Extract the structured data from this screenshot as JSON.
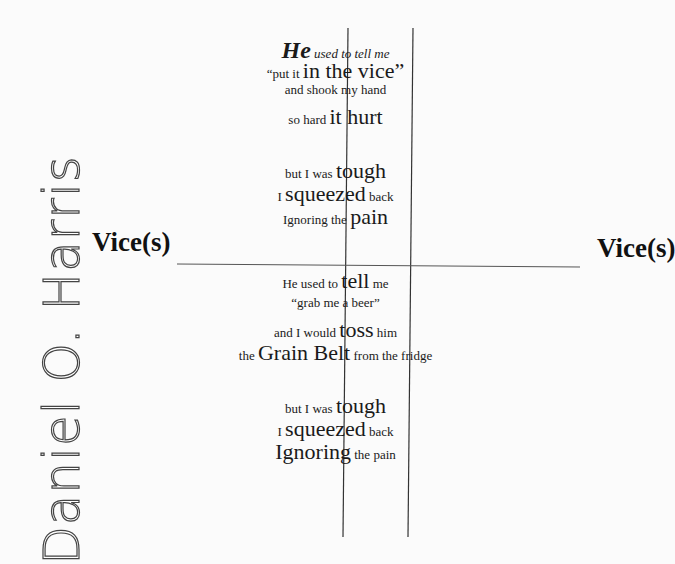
{
  "author": "Daniel O. Harris",
  "title_left": "Vice(s)",
  "title_right": "Vice(s)",
  "stanza1": [
    {
      "parts": [
        {
          "t": "He",
          "c": "xl"
        },
        {
          "t": " used to tell me",
          "c": "it"
        }
      ]
    },
    {
      "parts": [
        {
          "t": "“put it ",
          "c": ""
        },
        {
          "t": "in the vice",
          "c": "big"
        },
        {
          "t": "”",
          "c": "big"
        }
      ]
    },
    {
      "parts": [
        {
          "t": "and shook my hand",
          "c": ""
        }
      ]
    },
    {
      "parts": [
        {
          "t": "so hard ",
          "c": ""
        },
        {
          "t": "it hurt",
          "c": "big"
        }
      ]
    }
  ],
  "stanza2": [
    {
      "parts": [
        {
          "t": "but I was ",
          "c": ""
        },
        {
          "t": "tough",
          "c": "big"
        }
      ]
    },
    {
      "parts": [
        {
          "t": "I ",
          "c": ""
        },
        {
          "t": "squeezed",
          "c": "big"
        },
        {
          "t": " back",
          "c": ""
        }
      ]
    },
    {
      "parts": [
        {
          "t": "Ignoring the ",
          "c": ""
        },
        {
          "t": "pain",
          "c": "big"
        }
      ]
    }
  ],
  "stanza3": [
    {
      "parts": [
        {
          "t": "He used to ",
          "c": ""
        },
        {
          "t": "tell",
          "c": "big"
        },
        {
          "t": " me",
          "c": ""
        }
      ]
    },
    {
      "parts": [
        {
          "t": "“grab me a beer”",
          "c": ""
        }
      ]
    },
    {
      "parts": [
        {
          "t": "and I would ",
          "c": ""
        },
        {
          "t": "toss",
          "c": "big"
        },
        {
          "t": " him",
          "c": ""
        }
      ]
    },
    {
      "parts": [
        {
          "t": "the ",
          "c": ""
        },
        {
          "t": "Grain Belt",
          "c": "big"
        },
        {
          "t": " from the fridge",
          "c": ""
        }
      ]
    }
  ],
  "stanza4": [
    {
      "parts": [
        {
          "t": "but I was ",
          "c": ""
        },
        {
          "t": "tough",
          "c": "big"
        }
      ]
    },
    {
      "parts": [
        {
          "t": "I ",
          "c": ""
        },
        {
          "t": "squeezed",
          "c": "big"
        },
        {
          "t": " back",
          "c": ""
        }
      ]
    },
    {
      "parts": [
        {
          "t": "Ignoring",
          "c": "big"
        },
        {
          "t": " the pain",
          "c": ""
        }
      ]
    }
  ]
}
